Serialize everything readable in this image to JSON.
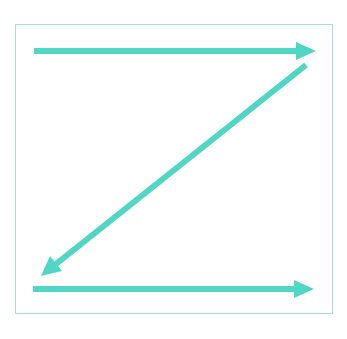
{
  "diagram": {
    "type": "z-pattern-flow",
    "color": "#4fd6c4",
    "frame_color": "#9fe3d8",
    "arrows": [
      {
        "name": "top-arrow",
        "from": [
          34,
          51
        ],
        "to": [
          316,
          51
        ],
        "direction": "right"
      },
      {
        "name": "diagonal-arrow",
        "from": [
          306,
          65
        ],
        "to": [
          41,
          276
        ],
        "direction": "down-left"
      },
      {
        "name": "bottom-arrow",
        "from": [
          33,
          289
        ],
        "to": [
          314,
          289
        ],
        "direction": "right"
      }
    ]
  }
}
